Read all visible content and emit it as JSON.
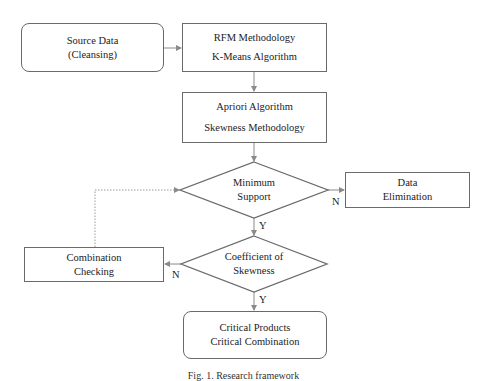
{
  "nodes": {
    "source": {
      "line1": "Source Data",
      "line2": "(Cleansing)"
    },
    "rfm": {
      "line1": "RFM Methodology",
      "line2": "K-Means Algorithm"
    },
    "apriori": {
      "line1": "Apriori Algorithm",
      "line2": "Skewness Methodology"
    },
    "min_support": {
      "line1": "Minimum",
      "line2": "Support"
    },
    "data_elimination": {
      "line1": "Data",
      "line2": "Elimination"
    },
    "coef_skewness": {
      "line1": "Coefficient of",
      "line2": "Skewness"
    },
    "combination_checking": {
      "line1": "Combination",
      "line2": "Checking"
    },
    "critical": {
      "line1": "Critical Products",
      "line2": "Critical Combination"
    }
  },
  "edge_labels": {
    "support_no": "N",
    "support_yes": "Y",
    "skewness_no": "N",
    "skewness_yes": "Y"
  },
  "caption": "Fig. 1. Research framework",
  "colors": {
    "stroke": "#6a6a6a",
    "connector": "#8a8a8a"
  }
}
